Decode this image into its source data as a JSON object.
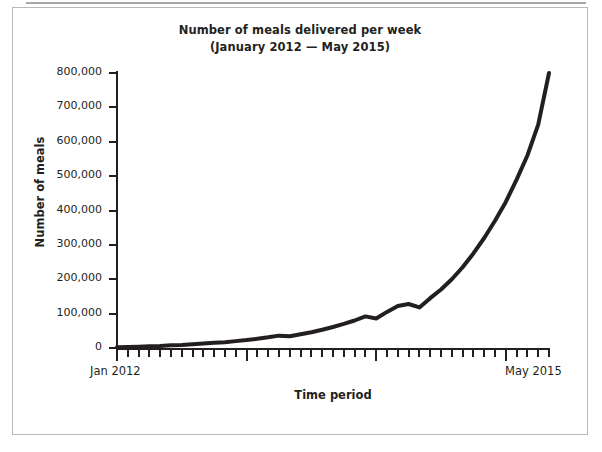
{
  "chart_data": {
    "type": "line",
    "title": "Number of meals delivered per week",
    "subtitle": "(January 2012 — May 2015)",
    "xlabel": "Time period",
    "ylabel": "Number of meals",
    "ylim": [
      0,
      800000
    ],
    "ytick_labels": [
      "800,000",
      "700,000",
      "600,000",
      "500,000",
      "400,000",
      "300,000",
      "200,000",
      "100,000",
      "0"
    ],
    "ytick_values": [
      800000,
      700000,
      600000,
      500000,
      400000,
      300000,
      200000,
      100000,
      0
    ],
    "xtick_start_label": "Jan 2012",
    "xtick_end_label": "May 2015",
    "x_axis_range": [
      "Jan 2012",
      "May 2015"
    ],
    "x_tick_count": 41,
    "x_major_tick_indices": [
      0,
      12,
      24,
      36
    ],
    "grid": false,
    "legend": false,
    "line_color": "#231f20",
    "line_width": 4,
    "x": [
      "Jan 2012",
      "Feb 2012",
      "Mar 2012",
      "Apr 2012",
      "May 2012",
      "Jun 2012",
      "Jul 2012",
      "Aug 2012",
      "Sep 2012",
      "Oct 2012",
      "Nov 2012",
      "Dec 2012",
      "Jan 2013",
      "Feb 2013",
      "Mar 2013",
      "Apr 2013",
      "May 2013",
      "Jun 2013",
      "Jul 2013",
      "Aug 2013",
      "Sep 2013",
      "Oct 2013",
      "Nov 2013",
      "Dec 2013",
      "Jan 2014",
      "Feb 2014",
      "Mar 2014",
      "Apr 2014",
      "May 2014",
      "Jun 2014",
      "Jul 2014",
      "Aug 2014",
      "Sep 2014",
      "Oct 2014",
      "Nov 2014",
      "Dec 2014",
      "Jan 2015",
      "Feb 2015",
      "Mar 2015",
      "Apr 2015",
      "May 2015"
    ],
    "values": [
      2000,
      3000,
      4000,
      5000,
      6000,
      8000,
      9000,
      11000,
      13000,
      15000,
      17000,
      20000,
      23000,
      27000,
      31000,
      36000,
      34000,
      40000,
      46000,
      53000,
      61000,
      70000,
      80000,
      92000,
      86000,
      105000,
      122000,
      128000,
      118000,
      145000,
      170000,
      200000,
      235000,
      275000,
      320000,
      370000,
      425000,
      490000,
      560000,
      650000,
      800000
    ],
    "annotations": []
  },
  "figure": {
    "border_color": "#b9b9b9",
    "top_rule_color": "#a8a8a8",
    "background": "#ffffff"
  }
}
